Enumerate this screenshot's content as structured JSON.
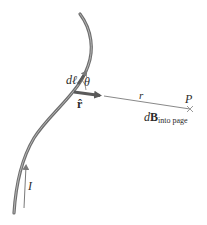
{
  "figure": {
    "labels": {
      "current_element": "dℓ",
      "angle": "θ",
      "unit_vector": "r̂",
      "distance": "r",
      "point": "P",
      "field_prefix": "d",
      "field_vector": "B",
      "field_subscript": "into page",
      "current": "I"
    },
    "colors": {
      "wire": "#6e6e6e",
      "wire_highlight": "#bdbdbd",
      "arrow": "#5a5a5a",
      "text": "#2b2b2b",
      "line": "#7a7a7a",
      "point_marker": "#9a9a9a"
    }
  }
}
